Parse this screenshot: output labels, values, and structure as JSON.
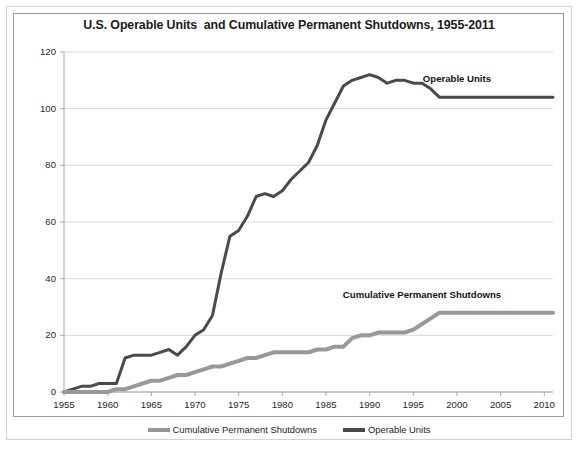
{
  "chart_data": {
    "type": "line",
    "title": "U.S. Operable Units  and Cumulative Permanent Shutdowns, 1955-2011",
    "xlabel": "",
    "ylabel": "",
    "xlim": [
      1955,
      2011
    ],
    "ylim": [
      0,
      120
    ],
    "grid": true,
    "grid_axis": "y",
    "legend_position": "bottom",
    "x_ticks": [
      "1955",
      "1960",
      "1965",
      "1970",
      "1975",
      "1980",
      "1985",
      "1990",
      "1995",
      "2000",
      "2005",
      "2010"
    ],
    "x_tick_values": [
      1955,
      1960,
      1965,
      1970,
      1975,
      1980,
      1985,
      1990,
      1995,
      2000,
      2005,
      2010
    ],
    "y_ticks": [
      "0",
      "20",
      "40",
      "60",
      "80",
      "100",
      "120"
    ],
    "y_tick_values": [
      0,
      20,
      40,
      60,
      80,
      100,
      120
    ],
    "x": [
      1955,
      1956,
      1957,
      1958,
      1959,
      1960,
      1961,
      1962,
      1963,
      1964,
      1965,
      1966,
      1967,
      1968,
      1969,
      1970,
      1971,
      1972,
      1973,
      1974,
      1975,
      1976,
      1977,
      1978,
      1979,
      1980,
      1981,
      1982,
      1983,
      1984,
      1985,
      1986,
      1987,
      1988,
      1989,
      1990,
      1991,
      1992,
      1993,
      1994,
      1995,
      1996,
      1997,
      1998,
      1999,
      2000,
      2001,
      2002,
      2003,
      2004,
      2005,
      2006,
      2007,
      2008,
      2009,
      2010,
      2011
    ],
    "series": [
      {
        "name": "Operable Units",
        "color": "#4a4a4a",
        "line_width": 3,
        "values": [
          0,
          1,
          2,
          2,
          3,
          3,
          3,
          12,
          13,
          13,
          13,
          14,
          15,
          13,
          16,
          20,
          22,
          27,
          42,
          55,
          57,
          62,
          69,
          70,
          69,
          71,
          75,
          78,
          81,
          87,
          96,
          102,
          108,
          110,
          111,
          112,
          111,
          109,
          110,
          110,
          109,
          109,
          107,
          104,
          104,
          104,
          104,
          104,
          104,
          104,
          104,
          104,
          104,
          104,
          104,
          104,
          104
        ]
      },
      {
        "name": "Cumulative Permanent Shutdowns",
        "color": "#989898",
        "line_width": 4,
        "values": [
          0,
          0,
          0,
          0,
          0,
          0,
          1,
          1,
          2,
          3,
          4,
          4,
          5,
          6,
          6,
          7,
          8,
          9,
          9,
          10,
          11,
          12,
          12,
          13,
          14,
          14,
          14,
          14,
          14,
          15,
          15,
          16,
          16,
          19,
          20,
          20,
          21,
          21,
          21,
          21,
          22,
          24,
          26,
          28,
          28,
          28,
          28,
          28,
          28,
          28,
          28,
          28,
          28,
          28,
          28,
          28,
          28
        ]
      }
    ],
    "annotations": [
      {
        "text": "Operable Units",
        "x": 2000,
        "y": 110,
        "name": "operable-units-label"
      },
      {
        "text": "Cumulative Permanent Shutdowns",
        "x": 1996,
        "y": 34,
        "name": "cumulative-permanent-shutdowns-label"
      }
    ],
    "legend": [
      {
        "label": "Cumulative Permanent Shutdowns",
        "color": "#989898"
      },
      {
        "label": "Operable Units",
        "color": "#4a4a4a"
      }
    ],
    "colors": {
      "operable_units": "#4a4a4a",
      "shutdowns": "#989898",
      "gridline": "#d9d9d9",
      "axis": "#a6a6a6",
      "text": "#262626",
      "background": "#ffffff"
    }
  }
}
